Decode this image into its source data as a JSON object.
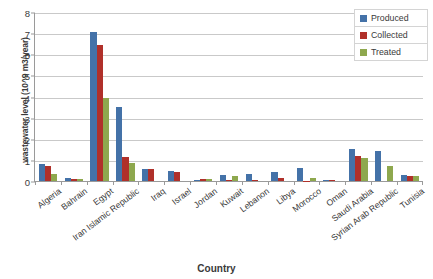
{
  "chart_data": {
    "type": "bar",
    "title": "",
    "xlabel": "Country",
    "ylabel": "wastewater level (10^9 m3/year)",
    "ylim": [
      0,
      8
    ],
    "yticks": [
      0,
      1,
      2,
      3,
      4,
      5,
      6,
      7,
      8
    ],
    "grid": true,
    "legend_position": "top-right",
    "categories": [
      "Algeria",
      "Bahrain",
      "Egypt",
      "Iran Islamic Republic",
      "Iraq",
      "Israel",
      "Jordan",
      "Kuwait",
      "Lebanon",
      "Libya",
      "Morocco",
      "Oman",
      "Saudi Arabia",
      "Syrian Arab Republic",
      "Tunisia"
    ],
    "series": [
      {
        "name": "Produced",
        "color": "#4472A8",
        "values": [
          0.82,
          0.15,
          7.05,
          3.5,
          0.57,
          0.47,
          0.04,
          0.3,
          0.32,
          0.45,
          0.6,
          0.05,
          1.5,
          1.4,
          0.27
        ]
      },
      {
        "name": "Collected",
        "color": "#B0302A",
        "values": [
          0.72,
          0.09,
          6.45,
          1.12,
          0.56,
          0.44,
          0.09,
          0.07,
          0.07,
          0.13,
          0.02,
          0.06,
          1.2,
          0.0,
          0.26
        ]
      },
      {
        "name": "Treated",
        "color": "#8EA84E",
        "values": [
          0.33,
          0.08,
          3.95,
          0.85,
          0.0,
          0.0,
          0.08,
          0.25,
          0.0,
          0.0,
          0.13,
          0.0,
          1.1,
          0.7,
          0.24
        ]
      }
    ]
  },
  "legend": {
    "entries": [
      {
        "label": "Produced",
        "color": "#4472A8"
      },
      {
        "label": "Collected",
        "color": "#B0302A"
      },
      {
        "label": "Treated",
        "color": "#8EA84E"
      }
    ]
  },
  "axes": {
    "y_title": "wastewater level (10^9 m3/year)",
    "x_title": "Country"
  }
}
